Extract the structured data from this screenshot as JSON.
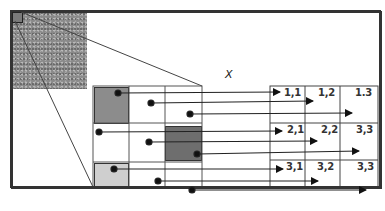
{
  "diagram": {
    "type": "patch-to-position mapping",
    "axis_label": "X",
    "source_image": {
      "description": "noisy grayscale image",
      "selected_patch": "top-left corner square"
    },
    "zoomed_grid": {
      "rows": 3,
      "cols": 3,
      "highlighted_cells": [
        {
          "row": 1,
          "col": 1,
          "fill": "#8c8c8c"
        },
        {
          "row": 2,
          "col": 3,
          "fill": "#6e6e6e"
        },
        {
          "row": 3,
          "col": 1,
          "fill": "#cfcfcf"
        }
      ]
    },
    "output_grid": {
      "rows": 3,
      "cols": 3,
      "labels": [
        [
          "1,1",
          "1,2",
          "1.3"
        ],
        [
          "2,1",
          "2,2",
          "2.3"
        ],
        [
          "3,1",
          "3,2",
          "3,3"
        ]
      ]
    }
  },
  "colors": {
    "line": "#333333",
    "frame": "#333333",
    "dot": "#111111"
  }
}
